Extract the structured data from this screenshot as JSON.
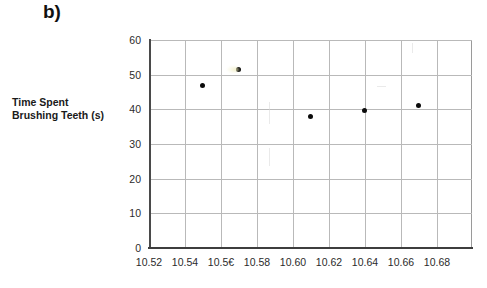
{
  "figure": {
    "panel_label": "b)"
  },
  "axes": {
    "y_title_line1": "Time Spent",
    "y_title_line2": "Brushing Teeth (s)",
    "y_ticks": [
      "0",
      "10",
      "20",
      "30",
      "40",
      "50",
      "60"
    ],
    "x_ticks": [
      "10.52",
      "10.54",
      "10.5€",
      "10.58",
      "10.60",
      "10.62",
      "10.64",
      "10.66",
      "10.68"
    ],
    "marker_color": "#0b0b0b",
    "grid_color": "#b9b9b9",
    "axis_color": "#3d3d3d"
  },
  "chart_data": {
    "type": "scatter",
    "title": "b)",
    "xlabel": "",
    "ylabel": "Time Spent Brushing Teeth (s)",
    "xlim": [
      10.51,
      10.69
    ],
    "ylim": [
      0,
      60
    ],
    "xticks": [
      10.52,
      10.54,
      10.56,
      10.58,
      10.6,
      10.62,
      10.64,
      10.66,
      10.68
    ],
    "yticks": [
      0,
      10,
      20,
      30,
      40,
      50,
      60
    ],
    "grid": true,
    "legend": "none",
    "series": [
      {
        "name": "Time Spent Brushing Teeth",
        "points": [
          {
            "x": 10.54,
            "y": 47.0
          },
          {
            "x": 10.56,
            "y": 51.5
          },
          {
            "x": 10.6,
            "y": 38.0
          },
          {
            "x": 10.63,
            "y": 39.7
          },
          {
            "x": 10.66,
            "y": 41.0
          }
        ]
      }
    ]
  }
}
